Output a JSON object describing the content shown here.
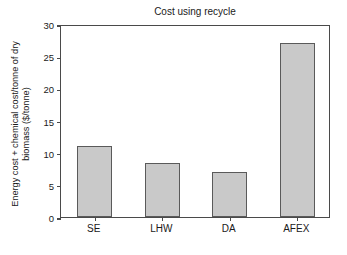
{
  "chart_data": {
    "type": "bar",
    "title": "Cost using recycle",
    "xlabel": "",
    "ylabel": "Energy cost + chemical cost/tonne of dry biomass ($/tonne)",
    "ylabel_lines": [
      "Energy cost + chemical cost/tonne of dry",
      "biomass ($/tonne)"
    ],
    "categories": [
      "SE",
      "LHW",
      "DA",
      "AFEX"
    ],
    "values": [
      11.0,
      8.4,
      7.0,
      27.0
    ],
    "ylim": [
      0,
      30
    ],
    "yticks": [
      0,
      5,
      10,
      15,
      20,
      25,
      30
    ],
    "ytick_labels": [
      "0",
      "5",
      "10",
      "15",
      "20",
      "25",
      "30"
    ],
    "grid": false,
    "legend": "none",
    "bar_fill_color": "#c9c9c9",
    "bar_edge_color": "#5a5a5a",
    "axis_color": "#4a4a4a",
    "background_color": "#ffffff"
  }
}
